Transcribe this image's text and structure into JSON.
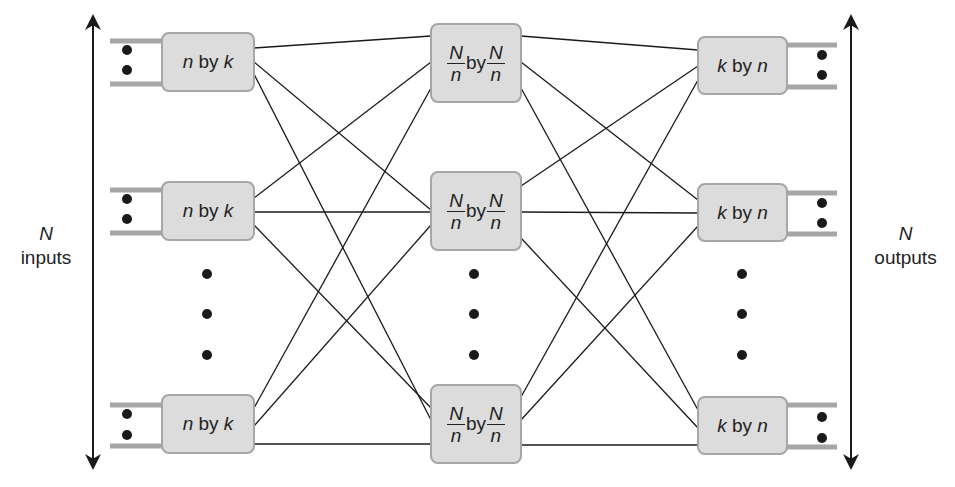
{
  "diagram": {
    "type": "three-stage Clos switching network",
    "left_label": {
      "var": "N",
      "text": "inputs"
    },
    "right_label": {
      "var": "N",
      "text": "outputs"
    },
    "stage1": [
      {
        "a": "n",
        "by": "by",
        "b": "k"
      },
      {
        "a": "n",
        "by": "by",
        "b": "k"
      },
      {
        "a": "n",
        "by": "by",
        "b": "k"
      }
    ],
    "stage2": [
      {
        "num1": "N",
        "den1": "n",
        "by": "by",
        "num2": "N",
        "den2": "n"
      },
      {
        "num1": "N",
        "den1": "n",
        "by": "by",
        "num2": "N",
        "den2": "n"
      },
      {
        "num1": "N",
        "den1": "n",
        "by": "by",
        "num2": "N",
        "den2": "n"
      }
    ],
    "stage3": [
      {
        "a": "k",
        "by": "by",
        "b": "n"
      },
      {
        "a": "k",
        "by": "by",
        "b": "n"
      },
      {
        "a": "k",
        "by": "by",
        "b": "n"
      }
    ],
    "colors": {
      "box_fill": "#dcdcdc",
      "box_border": "#a6a6a6",
      "line": "#1a1a1a",
      "port_bar": "#a6a6a6"
    }
  }
}
